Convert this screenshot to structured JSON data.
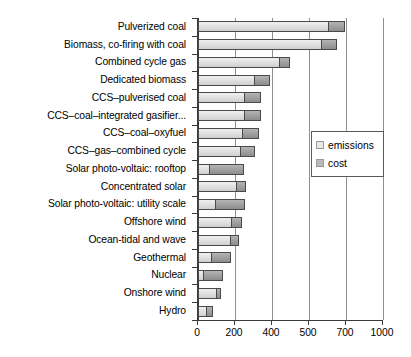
{
  "chart_data": {
    "type": "bar",
    "orientation": "horizontal",
    "stacked": true,
    "title": "",
    "xlabel": "",
    "ylabel": "",
    "xlim": [
      0,
      1000
    ],
    "grid": true,
    "legend_position": "center-right",
    "xticks": [
      {
        "label": "0",
        "value": 0
      },
      {
        "label": "200",
        "value": 200
      },
      {
        "label": "400",
        "value": 400
      },
      {
        "label": "500",
        "value": 500
      },
      {
        "label": "700",
        "value": 700
      },
      {
        "label": "1000",
        "value": 1000
      }
    ],
    "categories": [
      "Pulverized coal",
      "Biomass, co-firing with coal",
      "Combined cycle gas",
      "Dedicated biomass",
      "CCS–pulverised coal",
      "CCS–coal–integrated gasifier...",
      "CCS–coal–oxyfuel",
      "CCS–gas–combined cycle",
      "Solar photo-voltaic: rooftop",
      "Concentrated solar",
      "Solar photo-voltaic: utility scale",
      "Offshore wind",
      "Ocean-tidal and wave",
      "Geothermal",
      "Nuclear",
      "Onshore wind",
      "Hydro"
    ],
    "series": [
      {
        "name": "emissions",
        "color": "#e2e2e2",
        "values": [
          705,
          665,
          440,
          300,
          250,
          248,
          240,
          228,
          60,
          208,
          92,
          178,
          172,
          68,
          28,
          95,
          42
        ]
      },
      {
        "name": "cost",
        "color": "#a2a2a2",
        "values": [
          88,
          88,
          60,
          88,
          90,
          92,
          92,
          80,
          188,
          50,
          160,
          58,
          52,
          112,
          108,
          28,
          40
        ]
      }
    ]
  },
  "legend": {
    "items": [
      {
        "label": "emissions",
        "swatch_class": "sw-emissions"
      },
      {
        "label": "cost",
        "swatch_class": "sw-cost"
      }
    ]
  }
}
